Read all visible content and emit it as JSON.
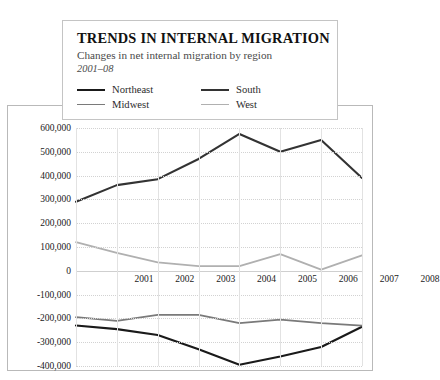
{
  "chart_data": {
    "type": "line",
    "title": "TRENDS IN INTERNAL MIGRATION",
    "subtitle": "Changes in net internal migration by region",
    "period": "2001–08",
    "xlabel": "",
    "ylabel": "",
    "categories": [
      "2001",
      "2002",
      "2003",
      "2004",
      "2005",
      "2006",
      "2007",
      "2008"
    ],
    "x": [
      2001,
      2002,
      2003,
      2004,
      2005,
      2006,
      2007,
      2008
    ],
    "ylim": [
      -400000,
      600000
    ],
    "ytick_values": [
      600000,
      500000,
      400000,
      300000,
      200000,
      100000,
      0,
      -100000,
      -200000,
      -300000,
      -400000
    ],
    "ytick_labels": [
      "600,000",
      "500,000",
      "400,000",
      "300,000",
      "200,000",
      "100,000",
      "0",
      "-100,000",
      "-200,000",
      "-300,000",
      "-400,000"
    ],
    "grid": true,
    "legend_position": "top",
    "series": [
      {
        "name": "Northeast",
        "color": "#1a1a1a",
        "values": [
          -230000,
          -245000,
          -270000,
          -330000,
          -395000,
          -360000,
          -320000,
          -235000
        ]
      },
      {
        "name": "Midwest",
        "color": "#7a7a7a",
        "values": [
          -195000,
          -210000,
          -185000,
          -185000,
          -220000,
          -205000,
          -220000,
          -230000
        ]
      },
      {
        "name": "South",
        "color": "#333333",
        "values": [
          290000,
          360000,
          385000,
          470000,
          575000,
          500000,
          550000,
          390000
        ]
      },
      {
        "name": "West",
        "color": "#b0b0b0",
        "values": [
          120000,
          75000,
          35000,
          20000,
          20000,
          70000,
          5000,
          65000
        ]
      }
    ]
  },
  "legend": {
    "items": [
      {
        "label": "Northeast"
      },
      {
        "label": "South"
      },
      {
        "label": "Midwest"
      },
      {
        "label": "West"
      }
    ]
  }
}
